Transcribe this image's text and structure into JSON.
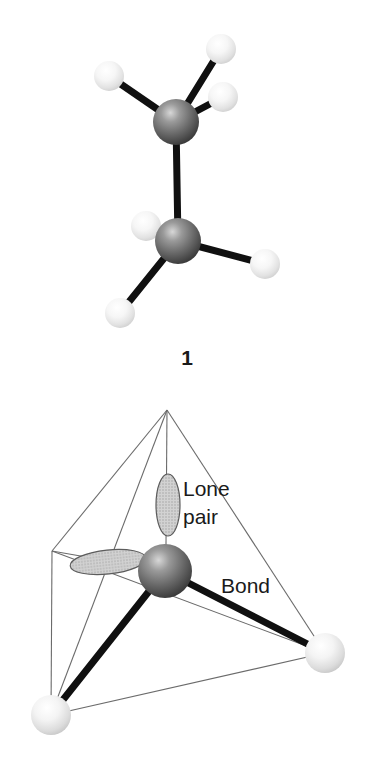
{
  "figure": {
    "background_color": "#ffffff",
    "panels": [
      {
        "id": "panel-ethane",
        "caption": "1",
        "description": "ball-and-stick model of an ethane-like molecule with two dark central atoms and six light hydrogen atoms",
        "atoms": [
          {
            "name": "carbon-upper",
            "type": "carbon",
            "color": "#6e6e6e",
            "cx": 176,
            "cy": 122,
            "r": 23
          },
          {
            "name": "carbon-lower",
            "type": "carbon",
            "color": "#6e6e6e",
            "cx": 178,
            "cy": 241,
            "r": 23
          },
          {
            "name": "hydrogen-upper-left",
            "type": "hydrogen",
            "color": "#f2f2f2",
            "cx": 109,
            "cy": 76,
            "r": 15
          },
          {
            "name": "hydrogen-upper-topright",
            "type": "hydrogen",
            "color": "#f2f2f2",
            "cx": 221,
            "cy": 49,
            "r": 15
          },
          {
            "name": "hydrogen-upper-right",
            "type": "hydrogen",
            "color": "#f2f2f2",
            "cx": 223,
            "cy": 97,
            "r": 15
          },
          {
            "name": "hydrogen-lower-left",
            "type": "hydrogen",
            "color": "#f2f2f2",
            "cx": 146,
            "cy": 226,
            "r": 15
          },
          {
            "name": "hydrogen-lower-right",
            "type": "hydrogen",
            "color": "#f2f2f2",
            "cx": 265,
            "cy": 264,
            "r": 15
          },
          {
            "name": "hydrogen-lower-bottomleft",
            "type": "hydrogen",
            "color": "#f2f2f2",
            "cx": 120,
            "cy": 313,
            "r": 15
          }
        ],
        "bonds": [
          {
            "name": "bond-c-c",
            "x1": 176,
            "y1": 122,
            "x2": 178,
            "y2": 241,
            "width": 7
          },
          {
            "name": "bond-cu-h-left",
            "x1": 176,
            "y1": 122,
            "x2": 109,
            "y2": 76,
            "width": 7
          },
          {
            "name": "bond-cu-h-topright",
            "x1": 176,
            "y1": 122,
            "x2": 221,
            "y2": 49,
            "width": 7
          },
          {
            "name": "bond-cu-h-right",
            "x1": 176,
            "y1": 122,
            "x2": 223,
            "y2": 97,
            "width": 7
          },
          {
            "name": "bond-cl-h-left",
            "x1": 178,
            "y1": 241,
            "x2": 146,
            "y2": 226,
            "width": 7
          },
          {
            "name": "bond-cl-h-right",
            "x1": 178,
            "y1": 241,
            "x2": 265,
            "y2": 264,
            "width": 7
          },
          {
            "name": "bond-cl-h-bottomleft",
            "x1": 178,
            "y1": 241,
            "x2": 120,
            "y2": 313,
            "width": 7
          }
        ]
      },
      {
        "id": "panel-tetrahedron",
        "description": "wireframe tetrahedron showing a central atom with two lone pair lobes and two bonds to light atoms",
        "labels": {
          "lone_pair_line1": "Lone",
          "lone_pair_line2": "pair",
          "bond": "Bond"
        },
        "vertices": [
          {
            "name": "vertex-apex",
            "x": 167,
            "y": 410
          },
          {
            "name": "vertex-back-left",
            "x": 52,
            "y": 551
          },
          {
            "name": "vertex-front-bottom-left",
            "x": 51,
            "y": 715
          },
          {
            "name": "vertex-right",
            "x": 325,
            "y": 653
          }
        ],
        "atoms": [
          {
            "name": "central-atom",
            "type": "central",
            "color": "#6e6e6e",
            "cx": 165,
            "cy": 571,
            "r": 27
          },
          {
            "name": "ligand-bottom-left",
            "type": "ligand",
            "color": "#ededed",
            "cx": 51,
            "cy": 715,
            "r": 20
          },
          {
            "name": "ligand-right",
            "type": "ligand",
            "color": "#ededed",
            "cx": 325,
            "cy": 653,
            "r": 20
          }
        ],
        "lone_pairs": [
          {
            "name": "lone-pair-lobe-vertical",
            "cx": 168,
            "cy": 505,
            "rx": 12,
            "ry": 31,
            "rotation": 0,
            "fill": "#cfcfcf"
          },
          {
            "name": "lone-pair-lobe-horizontal",
            "cx": 108,
            "cy": 562,
            "rx": 38,
            "ry": 12,
            "rotation": -6,
            "fill": "#cfcfcf"
          }
        ],
        "bonds": [
          {
            "name": "bond-central-to-bottom-left",
            "x1": 165,
            "y1": 571,
            "x2": 51,
            "y2": 715,
            "width": 7
          },
          {
            "name": "bond-central-to-right",
            "x1": 165,
            "y1": 571,
            "x2": 325,
            "y2": 653,
            "width": 7
          }
        ],
        "wireframe_edges": [
          {
            "name": "edge-apex-backleft",
            "x1": 167,
            "y1": 410,
            "x2": 52,
            "y2": 551
          },
          {
            "name": "edge-apex-bottomleft",
            "x1": 167,
            "y1": 410,
            "x2": 51,
            "y2": 715
          },
          {
            "name": "edge-apex-right",
            "x1": 167,
            "y1": 410,
            "x2": 325,
            "y2": 653
          },
          {
            "name": "edge-apex-center-down",
            "x1": 167,
            "y1": 410,
            "x2": 166,
            "y2": 545
          },
          {
            "name": "edge-backleft-bottomleft",
            "x1": 52,
            "y1": 551,
            "x2": 51,
            "y2": 715
          },
          {
            "name": "edge-backleft-right",
            "x1": 52,
            "y1": 551,
            "x2": 325,
            "y2": 653
          },
          {
            "name": "edge-bottomleft-right",
            "x1": 51,
            "y1": 715,
            "x2": 325,
            "y2": 653
          }
        ],
        "label_positions": {
          "lone_pair": {
            "x": 183,
            "y": 496
          },
          "pair": {
            "x": 183,
            "y": 524
          },
          "bond": {
            "x": 221,
            "y": 593
          }
        },
        "caption_position": {
          "x": 187,
          "y": 365
        }
      }
    ]
  }
}
